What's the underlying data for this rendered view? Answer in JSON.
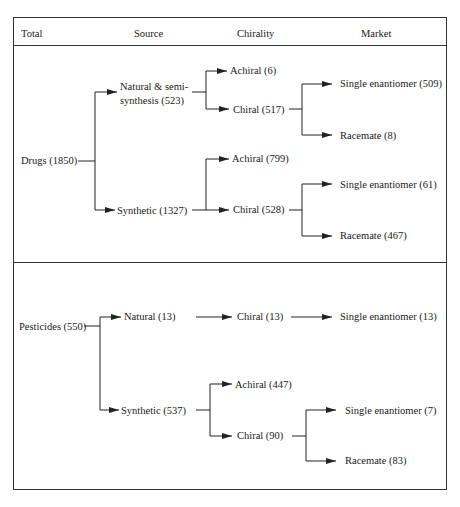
{
  "header": {
    "total": "Total",
    "source": "Source",
    "chirality": "Chirality",
    "market": "Market"
  },
  "drugs": {
    "total": "Drugs (1850)",
    "natural": {
      "line1": "Natural & semi-",
      "line2": "synthesis (523)"
    },
    "natural_achiral": "Achiral (6)",
    "natural_chiral": "Chiral (517)",
    "natural_single": "Single enantiomer (509)",
    "natural_racemate": "Racemate (8)",
    "synthetic": "Synthetic (1327)",
    "synthetic_achiral": "Achiral (799)",
    "synthetic_chiral": "Chiral (528)",
    "synthetic_single": "Single enantiomer (61)",
    "synthetic_racemate": "Racemate (467)"
  },
  "pesticides": {
    "total": "Pesticides (550)",
    "natural": "Natural  (13)",
    "natural_chiral": "Chiral (13)",
    "natural_single": "Single enantiomer (13)",
    "synthetic": "Synthetic (537)",
    "synthetic_achiral": "Achiral (447)",
    "synthetic_chiral": "Chiral (90)",
    "synthetic_single": "Single enantiomer (7)",
    "synthetic_racemate": "Racemate (83)"
  },
  "colors": {
    "line": "#222222",
    "text": "#1a1a1a",
    "border": "#333333"
  }
}
